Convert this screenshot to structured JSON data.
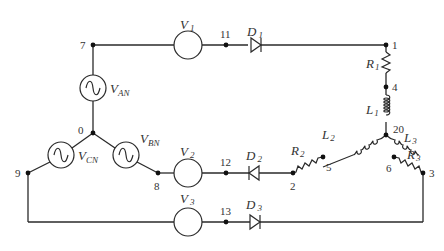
{
  "diagram": {
    "type": "three-phase rectifier circuit schematic",
    "sources": [
      {
        "id": "VAN",
        "main": "V",
        "sub": "AN",
        "type": "ac-source"
      },
      {
        "id": "VBN",
        "main": "V",
        "sub": "BN",
        "type": "ac-source"
      },
      {
        "id": "VCN",
        "main": "V",
        "sub": "CN",
        "type": "ac-source"
      }
    ],
    "meters": [
      {
        "id": "V1",
        "main": "V",
        "sub": "1"
      },
      {
        "id": "V2",
        "main": "V",
        "sub": "2"
      },
      {
        "id": "V3",
        "main": "V",
        "sub": "3"
      }
    ],
    "diodes": [
      {
        "id": "D1",
        "main": "D",
        "sub": "1",
        "direction": "right"
      },
      {
        "id": "D2",
        "main": "D",
        "sub": "2",
        "direction": "left"
      },
      {
        "id": "D3",
        "main": "D",
        "sub": "3",
        "direction": "right"
      }
    ],
    "resistors": [
      {
        "id": "R1",
        "main": "R",
        "sub": "1"
      },
      {
        "id": "R2",
        "main": "R",
        "sub": "2"
      },
      {
        "id": "R3",
        "main": "R",
        "sub": "3"
      }
    ],
    "inductors": [
      {
        "id": "L1",
        "main": "L",
        "sub": "1"
      },
      {
        "id": "L2",
        "main": "L",
        "sub": "2"
      },
      {
        "id": "L3",
        "main": "L",
        "sub": "3"
      }
    ],
    "nodes": {
      "n0": "0",
      "n1": "1",
      "n2": "2",
      "n3": "3",
      "n4": "4",
      "n5": "5",
      "n6": "6",
      "n7": "7",
      "n8": "8",
      "n9": "9",
      "n11": "11",
      "n12": "12",
      "n13": "13",
      "n20": "20"
    }
  }
}
